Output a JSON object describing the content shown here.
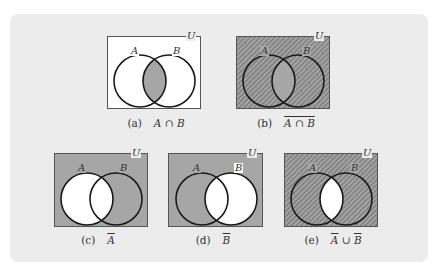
{
  "figure": {
    "background": "#ececec",
    "colors": {
      "fill_gray": "#a6a6a6",
      "hatch_line": "#555555",
      "outline": "#1a1a1a",
      "box_border": "#555555",
      "white": "#ffffff"
    },
    "set_labels": {
      "a": "A",
      "b": "B",
      "universe": "U"
    },
    "panels": [
      {
        "id": "a",
        "tag": "(a)",
        "expr_parts": [
          {
            "t": "A ∩ B",
            "over": false
          }
        ],
        "shading": "intersection-gray"
      },
      {
        "id": "b",
        "tag": "(b)",
        "expr_parts": [
          {
            "t": "A ∩ B",
            "over": true
          }
        ],
        "shading": "complement-of-intersection-hatched"
      },
      {
        "id": "c",
        "tag": "(c)",
        "expr_parts": [
          {
            "t": "A",
            "over": true
          }
        ],
        "shading": "complement-A-gray"
      },
      {
        "id": "d",
        "tag": "(d)",
        "expr_parts": [
          {
            "t": "B",
            "over": true
          }
        ],
        "shading": "complement-B-gray"
      },
      {
        "id": "e",
        "tag": "(e)",
        "expr_parts": [
          {
            "t": "A",
            "over": true
          },
          {
            "t": " ∪ ",
            "over": false
          },
          {
            "t": "B",
            "over": true
          }
        ],
        "shading": "union-of-complements-hatched"
      }
    ]
  }
}
